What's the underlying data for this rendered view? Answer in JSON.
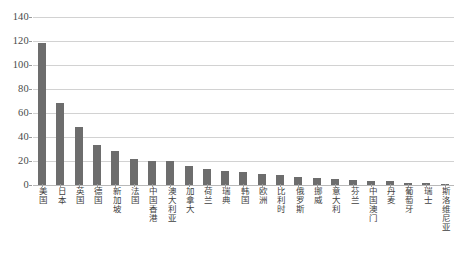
{
  "chart_data": {
    "type": "bar",
    "title": "",
    "xlabel": "",
    "ylabel": "",
    "ylim": [
      0,
      140
    ],
    "yticks": [
      0,
      20,
      40,
      60,
      80,
      100,
      120,
      140
    ],
    "grid": true,
    "legend": "none",
    "bar_color": "#6d6d6d",
    "gridline_color": "#d2d2d2",
    "categories": [
      "美国",
      "日本",
      "英国",
      "德国",
      "新加坡",
      "法国",
      "中国香港",
      "澳大利亚",
      "加拿大",
      "荷兰",
      "瑞典",
      "韩国",
      "欧洲",
      "比利时",
      "俄罗斯",
      "挪威",
      "意大利",
      "芬兰",
      "中国澳门",
      "丹麦",
      "葡萄牙",
      "瑞士",
      "斯洛维尼亚"
    ],
    "values": [
      118,
      68,
      48,
      33,
      28,
      22,
      20,
      20,
      16,
      13,
      12,
      11,
      9,
      8,
      7,
      6,
      5,
      4,
      3,
      3,
      2,
      2,
      1
    ],
    "series": [
      {
        "name": "",
        "values": [
          118,
          68,
          48,
          33,
          28,
          22,
          20,
          20,
          16,
          13,
          12,
          11,
          9,
          8,
          7,
          6,
          5,
          4,
          3,
          3,
          2,
          2,
          1
        ]
      }
    ]
  }
}
